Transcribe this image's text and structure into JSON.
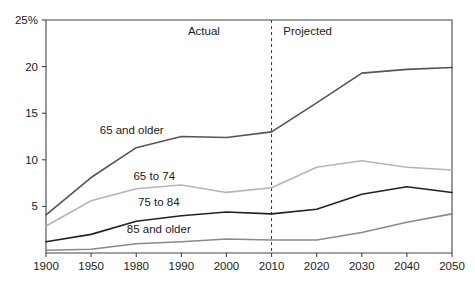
{
  "chart_data": {
    "type": "line",
    "title": "",
    "xlabel": "",
    "ylabel": "",
    "ylim": [
      0,
      25
    ],
    "xlim": [
      1900,
      2050
    ],
    "grid": false,
    "legend": "inline-labels",
    "y_tick_labels": [
      "25%",
      "20",
      "15",
      "10",
      "5"
    ],
    "y_tick_values": [
      25,
      20,
      15,
      10,
      5
    ],
    "x": [
      1900,
      1950,
      1980,
      1990,
      2000,
      2010,
      2020,
      2030,
      2040,
      2050
    ],
    "x_tick_labels": [
      "1900",
      "1950",
      "1980",
      "1990",
      "2000",
      "2010",
      "2020",
      "2030",
      "2040",
      "2050"
    ],
    "annotations": [
      {
        "text": "Actual",
        "x": 1995
      },
      {
        "text": "Projected",
        "x": 2018
      }
    ],
    "divider": {
      "x": 2010,
      "style": "dashed"
    },
    "series": [
      {
        "name": "65 and older",
        "color": "#555555",
        "label": "65 and older",
        "label_x": 1977,
        "label_y": 12.8,
        "values": [
          4.1,
          8.1,
          11.3,
          12.5,
          12.4,
          13.0,
          16.1,
          19.3,
          19.7,
          19.9
        ]
      },
      {
        "name": "65 to 74",
        "color": "#b5b5b5",
        "label": "65 to 74",
        "label_x": 1984,
        "label_y": 7.8,
        "values": [
          2.9,
          5.6,
          6.9,
          7.3,
          6.5,
          7.0,
          9.2,
          9.9,
          9.2,
          8.9
        ]
      },
      {
        "name": "75 to 84",
        "color": "#222222",
        "label": "75 to 84",
        "label_x": 1985,
        "label_y": 5.0,
        "values": [
          1.2,
          2.0,
          3.4,
          4.0,
          4.4,
          4.2,
          4.7,
          6.3,
          7.1,
          6.5
        ]
      },
      {
        "name": "85 and older",
        "color": "#8a8a8a",
        "label": "85 and older",
        "label_x": 1985,
        "label_y": 2.1,
        "values": [
          0.3,
          0.4,
          1.0,
          1.2,
          1.5,
          1.4,
          1.4,
          2.2,
          3.3,
          4.2
        ]
      }
    ]
  }
}
